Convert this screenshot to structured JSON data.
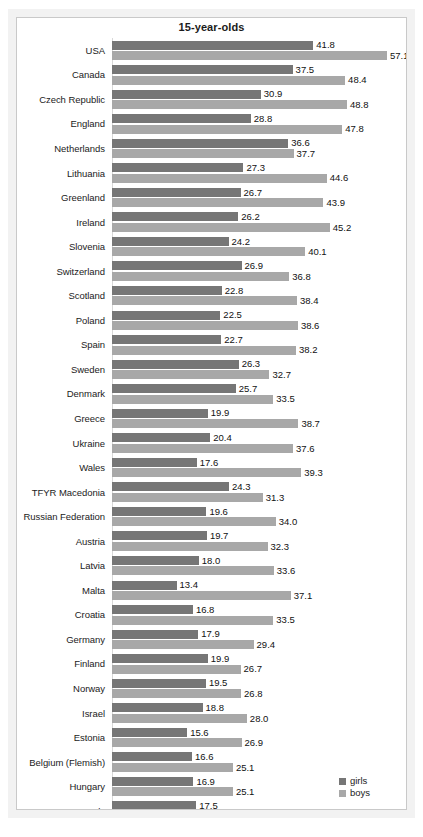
{
  "chart_data": {
    "type": "bar",
    "orientation": "horizontal",
    "title": "15-year-olds",
    "xlabel": "",
    "ylabel": "",
    "xlim": [
      0,
      60
    ],
    "grid": false,
    "legend_position": "bottom-right",
    "categories": [
      "USA",
      "Canada",
      "Czech Republic",
      "England",
      "Netherlands",
      "Lithuania",
      "Greenland",
      "Ireland",
      "Slovenia",
      "Switzerland",
      "Scotland",
      "Poland",
      "Spain",
      "Sweden",
      "Denmark",
      "Greece",
      "Ukraine",
      "Wales",
      "TFYR Macedonia",
      "Russian Federation",
      "Austria",
      "Latvia",
      "Malta",
      "Croatia",
      "Germany",
      "Finland",
      "Norway",
      "Israel",
      "Estonia",
      "Belgium (Flemish)",
      "Hungary",
      "Italy",
      "France",
      "Portugal",
      "HBSC average"
    ],
    "series": [
      {
        "name": "girls",
        "color": "#767676",
        "values": [
          41.8,
          37.5,
          30.9,
          28.8,
          36.6,
          27.3,
          26.7,
          26.2,
          24.2,
          26.9,
          22.8,
          22.5,
          22.7,
          26.3,
          25.7,
          19.9,
          20.4,
          17.6,
          24.3,
          19.6,
          19.7,
          18.0,
          13.4,
          16.8,
          17.9,
          19.9,
          19.5,
          18.8,
          15.6,
          16.6,
          16.9,
          17.5,
          11.2,
          13.2,
          22.3
        ]
      },
      {
        "name": "boys",
        "color": "#a8a8a8",
        "values": [
          57.1,
          48.4,
          48.8,
          47.8,
          37.7,
          44.6,
          43.9,
          45.2,
          40.1,
          36.8,
          38.4,
          38.6,
          38.2,
          32.7,
          33.5,
          38.7,
          37.6,
          39.3,
          31.3,
          34.0,
          32.3,
          33.6,
          37.1,
          33.5,
          29.4,
          26.7,
          26.8,
          28.0,
          26.9,
          25.1,
          25.1,
          22.6,
          26.5,
          24.6,
          35.3
        ]
      }
    ],
    "value_labels": {
      "girls": [
        "41.8",
        "37.5",
        "30.9",
        "28.8",
        "36.6",
        "27.3",
        "26.7",
        "26.2",
        "24.2",
        "26.9",
        "22.8",
        "22.5",
        "22.7",
        "26.3",
        "25.7",
        "19.9",
        "20.4",
        "17.6",
        "24.3",
        "19.6",
        "19.7",
        "18.0",
        "13.4",
        "16.8",
        "17.9",
        "19.9",
        "19.5",
        "18.8",
        "15.6",
        "16.6",
        "16.9",
        "17.5",
        "11.2",
        "13.2",
        "22.3"
      ],
      "boys": [
        "57.1",
        "48.4",
        "48.8",
        "47.8",
        "37.7",
        "44.6",
        "43.9",
        "45.2",
        "40.1",
        "36.8",
        "38.4",
        "38.6",
        "38.2",
        "32.7",
        "33.5",
        "38.7",
        "37.6",
        "39.3",
        "31.3",
        "34.0",
        "32.3",
        "33.6",
        "37.1",
        "33.5",
        "29.4",
        "26.7",
        "26.8",
        "28.0",
        "26.9",
        "25.1",
        "25.1",
        "22.6",
        "26.5",
        "24.6",
        "35.3"
      ]
    }
  },
  "legend": {
    "items": [
      {
        "label": "girls",
        "key": "girls"
      },
      {
        "label": "boys",
        "key": "boys"
      }
    ]
  },
  "caption": {
    "text": ""
  }
}
